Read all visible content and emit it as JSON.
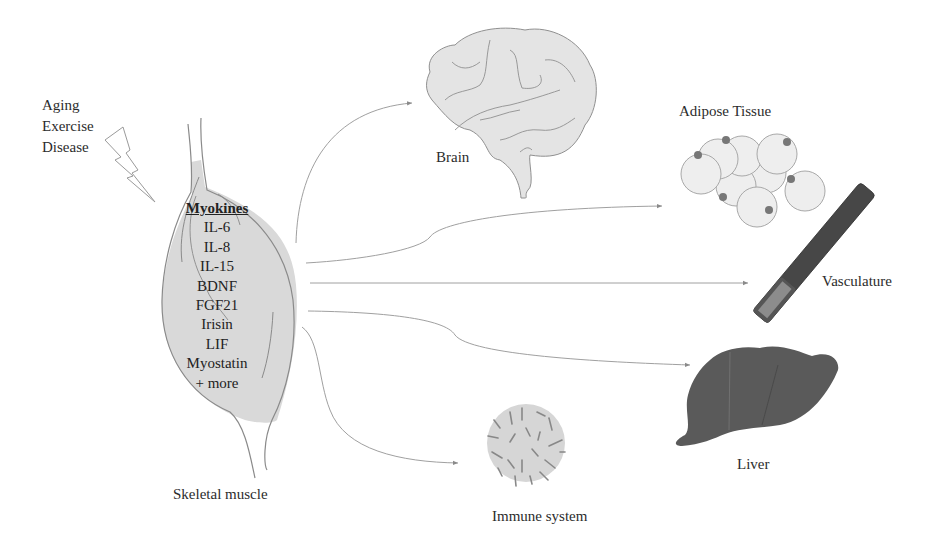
{
  "stimuli": [
    "Aging",
    "Exercise",
    "Disease"
  ],
  "muscle": {
    "label": "Skeletal muscle",
    "myokines_title": "Myokines",
    "myokines": [
      "IL-6",
      "IL-8",
      "IL-15",
      "BDNF",
      "FGF21",
      "Irisin",
      "LIF",
      "Myostatin",
      "+ more"
    ]
  },
  "targets": {
    "brain": "Brain",
    "adipose": "Adipose Tissue",
    "vasculature": "Vasculature",
    "liver": "Liver",
    "immune": "Immune system"
  },
  "colors": {
    "muscle_fill": "#d9d9d9",
    "organ_fill": "#e4e4e4",
    "outline": "#8a8a8a",
    "liver_fill": "#5a5a5a",
    "vessel_dark": "#474747",
    "vessel_light": "#8c8c8c",
    "adipocyte_nucleus": "#777777",
    "arrow": "#9a9a9a"
  }
}
